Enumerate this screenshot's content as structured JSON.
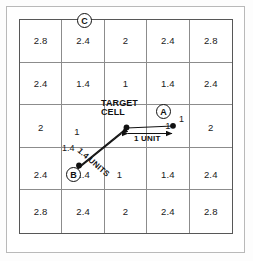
{
  "figure": {
    "type": "distance-grid-diagram",
    "title": "",
    "grid": {
      "rows": 5,
      "cols": 5,
      "values": [
        [
          "2.8",
          "2.4",
          "2",
          "2.4",
          "2.8"
        ],
        [
          "2.4",
          "1.4",
          "1",
          "1.4",
          "2.4"
        ],
        [
          "2",
          "1",
          "",
          "1",
          "2"
        ],
        [
          "2.4",
          "1.4",
          "1",
          "1.4",
          "2.4"
        ],
        [
          "2.8",
          "2.4",
          "2",
          "2.4",
          "2.8"
        ]
      ]
    },
    "annotations": {
      "target_label_line1": "TARGET",
      "target_label_line2": "CELL",
      "marker_a": "A",
      "marker_b": "B",
      "marker_c": "C",
      "measure_horizontal": "1 UNIT",
      "measure_diagonal": "1.4 UNITS",
      "value_at_a": "1",
      "value_at_b": "1.4"
    },
    "colors": {
      "grid_line": "#8c8c8c",
      "grid_border": "#575757",
      "frame": "#b9b9b9",
      "ink": "#111111",
      "background": "#ffffff"
    }
  }
}
